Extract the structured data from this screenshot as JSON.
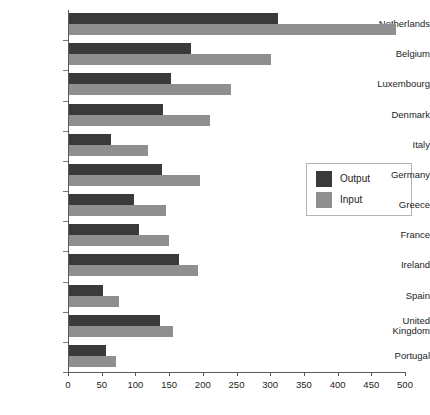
{
  "chart_data": {
    "type": "bar",
    "orientation": "horizontal",
    "title": "",
    "xlabel": "",
    "ylabel": "",
    "xlim": [
      0,
      500
    ],
    "xticks": [
      0,
      50,
      100,
      150,
      200,
      250,
      300,
      350,
      400,
      450,
      500
    ],
    "grid": false,
    "legend_position": "right",
    "categories": [
      "Netherlands",
      "Belgium",
      "Luxembourg",
      "Denmark",
      "Italy",
      "Germany",
      "Greece",
      "France",
      "Ireland",
      "Spain",
      "United Kingdom",
      "Portugal"
    ],
    "series": [
      {
        "name": "Output",
        "color": "#3a3a3a",
        "values": [
          310,
          181,
          151,
          139,
          62,
          138,
          96,
          104,
          163,
          50,
          135,
          55
        ]
      },
      {
        "name": "Input",
        "color": "#8f8f8f",
        "values": [
          485,
          300,
          240,
          209,
          117,
          194,
          144,
          148,
          191,
          74,
          154,
          70
        ]
      }
    ]
  },
  "legend": {
    "items": [
      {
        "label": "Output",
        "swatch": "output"
      },
      {
        "label": "Input",
        "swatch": "input"
      }
    ]
  },
  "colors": {
    "output": "#3a3a3a",
    "input": "#8f8f8f",
    "axis": "#5a5a5a",
    "background": "#ffffff"
  }
}
